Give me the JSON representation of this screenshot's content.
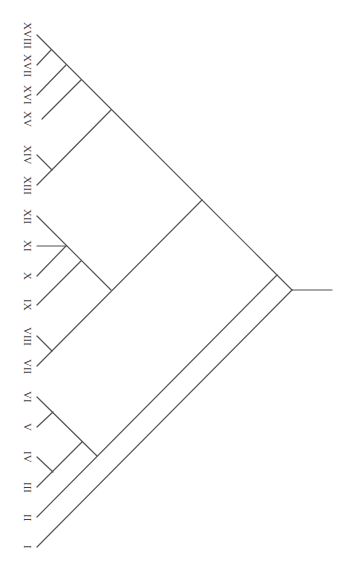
{
  "diagram": {
    "type": "cladogram",
    "orientation": "root-right, leaves-left",
    "line_color": "#555555",
    "leaves": [
      {
        "label": "XVIII",
        "x": 37,
        "y": 35
      },
      {
        "label": "XVII",
        "x": 37,
        "y": 65
      },
      {
        "label": "XVI",
        "x": 37,
        "y": 95
      },
      {
        "label": "XV",
        "x": 42,
        "y": 119
      },
      {
        "label": "XIV",
        "x": 37,
        "y": 155
      },
      {
        "label": "XIII",
        "x": 37,
        "y": 185
      },
      {
        "label": "XII",
        "x": 37,
        "y": 216
      },
      {
        "label": "XI",
        "x": 37,
        "y": 246
      },
      {
        "label": "X",
        "x": 37,
        "y": 276
      },
      {
        "label": "IX",
        "x": 37,
        "y": 305
      },
      {
        "label": "VIII",
        "x": 37,
        "y": 336
      },
      {
        "label": "VII",
        "x": 37,
        "y": 366
      },
      {
        "label": "VI",
        "x": 37,
        "y": 397
      },
      {
        "label": "V",
        "x": 37,
        "y": 427
      },
      {
        "label": "IV",
        "x": 37,
        "y": 457
      },
      {
        "label": "III",
        "x": 37,
        "y": 487
      },
      {
        "label": "II",
        "x": 37,
        "y": 517
      },
      {
        "label": "I",
        "x": 37,
        "y": 547
      }
    ],
    "topology": "(I,(II,((III,IV),(V,VI))),(((VII,VIII),(IX,(X,XI,XII))),((XIII,XIV),(XV,(XVI,(XVII,XVIII))))))",
    "edges": [
      [
        37,
        35,
        292,
        290
      ],
      [
        37,
        65,
        51,
        50
      ],
      [
        37,
        95,
        66,
        65
      ],
      [
        42,
        119,
        81,
        80
      ],
      [
        37,
        155,
        52,
        170
      ],
      [
        37,
        185,
        111,
        110
      ],
      [
        37,
        216,
        111,
        290
      ],
      [
        37,
        246,
        66,
        246
      ],
      [
        37,
        276,
        66,
        246
      ],
      [
        37,
        305,
        81,
        261
      ],
      [
        37,
        336,
        52,
        351
      ],
      [
        37,
        366,
        202,
        200
      ],
      [
        37,
        397,
        97,
        456
      ],
      [
        37,
        427,
        53,
        412
      ],
      [
        37,
        457,
        53,
        472
      ],
      [
        37,
        487,
        82,
        442
      ],
      [
        37,
        517,
        277,
        275
      ],
      [
        37,
        547,
        292,
        290
      ],
      [
        292,
        290,
        332,
        290
      ]
    ]
  }
}
